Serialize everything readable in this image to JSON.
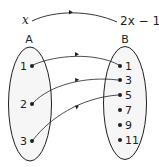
{
  "diagram": {
    "type": "function-mapping",
    "rule": {
      "input": "x",
      "output": "2x − 1"
    },
    "sets": [
      {
        "name": "A",
        "elements": [
          "1",
          "2",
          "3"
        ]
      },
      {
        "name": "B",
        "elements": [
          "1",
          "3",
          "5",
          "7",
          "9",
          "11"
        ]
      }
    ],
    "mappings": [
      {
        "from": "1",
        "to": "1"
      },
      {
        "from": "2",
        "to": "3"
      },
      {
        "from": "3",
        "to": "5"
      }
    ],
    "colors": {
      "stroke": "#231f20",
      "fill": "#f6f6f6"
    }
  }
}
